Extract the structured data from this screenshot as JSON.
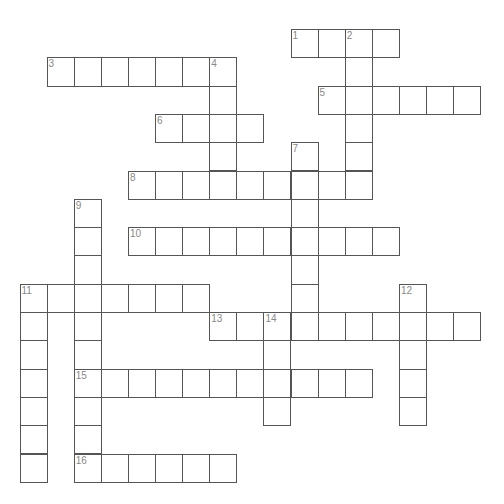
{
  "puzzle": {
    "geometry": {
      "origin_x": 19.5,
      "origin_y": 29,
      "cell_w": 27.1,
      "cell_h": 28.3
    },
    "colors": {
      "line": "#555555",
      "number": "#888888",
      "fill": "#ffffff"
    },
    "words": [
      {
        "number": "1",
        "direction": "across",
        "row": 0,
        "col": 10,
        "length": 4
      },
      {
        "number": "2",
        "direction": "down",
        "row": 0,
        "col": 12,
        "length": 6
      },
      {
        "number": "3",
        "direction": "across",
        "row": 1,
        "col": 1,
        "length": 7
      },
      {
        "number": "4",
        "direction": "down",
        "row": 1,
        "col": 7,
        "length": 5
      },
      {
        "number": "5",
        "direction": "across",
        "row": 2,
        "col": 11,
        "length": 6
      },
      {
        "number": "6",
        "direction": "across",
        "row": 3,
        "col": 5,
        "length": 4
      },
      {
        "number": "7",
        "direction": "down",
        "row": 4,
        "col": 10,
        "length": 7
      },
      {
        "number": "8",
        "direction": "across",
        "row": 5,
        "col": 4,
        "length": 9
      },
      {
        "number": "9",
        "direction": "down",
        "row": 6,
        "col": 2,
        "length": 10
      },
      {
        "number": "10",
        "direction": "across",
        "row": 7,
        "col": 4,
        "length": 10
      },
      {
        "number": "11",
        "direction": "across",
        "row": 9,
        "col": 0,
        "length": 7
      },
      {
        "number": "11",
        "direction": "down",
        "row": 9,
        "col": 0,
        "length": 7
      },
      {
        "number": "12",
        "direction": "down",
        "row": 9,
        "col": 14,
        "length": 5
      },
      {
        "number": "13",
        "direction": "across",
        "row": 10,
        "col": 7,
        "length": 10
      },
      {
        "number": "14",
        "direction": "down",
        "row": 10,
        "col": 9,
        "length": 4
      },
      {
        "number": "15",
        "direction": "across",
        "row": 12,
        "col": 2,
        "length": 11
      },
      {
        "number": "16",
        "direction": "across",
        "row": 15,
        "col": 2,
        "length": 6
      }
    ]
  }
}
